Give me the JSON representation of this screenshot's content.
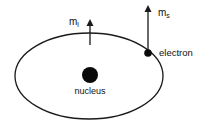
{
  "diagram": {
    "type": "atomic-orbit",
    "colors": {
      "stroke": "#1a1a1a",
      "nucleus": "#0a0a0a",
      "background": "#ffffff"
    },
    "orbit": {
      "cx": 89,
      "cy": 76,
      "rx": 74,
      "ry": 43
    },
    "nucleus": {
      "cx": 90,
      "cy": 75,
      "r": 8,
      "label": "nucleus"
    },
    "electron": {
      "cx": 148,
      "cy": 53,
      "r": 4,
      "label": "electron"
    },
    "arrows": [
      {
        "id": "ml",
        "label_main": "m",
        "label_sub": "l",
        "x": 90,
        "y_from": 45,
        "y_to": 21
      },
      {
        "id": "ms",
        "label_main": "m",
        "label_sub": "s",
        "x": 148,
        "y_from": 53,
        "y_to": 7
      }
    ]
  }
}
